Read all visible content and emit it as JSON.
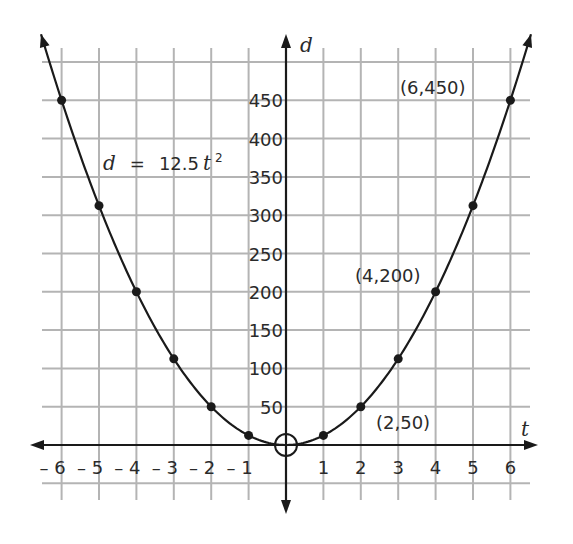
{
  "chart_data": {
    "type": "line",
    "title": "",
    "equation": "d = 12.5t²",
    "equation_parts": {
      "lhs": "d",
      "eq": "=",
      "coef": "12.5",
      "var": "t",
      "exp": "2"
    },
    "xlabel": "t",
    "ylabel": "d",
    "xlim": [
      -6.5,
      6.5
    ],
    "ylim": [
      -50,
      500
    ],
    "grid": true,
    "x_ticks": [
      -6,
      -5,
      -4,
      -3,
      -2,
      -1,
      1,
      2,
      3,
      4,
      5,
      6
    ],
    "x_tick_labels": [
      "– 6",
      "– 5",
      "– 4",
      "– 3",
      "– 2",
      "– 1",
      "1",
      "2",
      "3",
      "4",
      "5",
      "6"
    ],
    "y_ticks": [
      50,
      100,
      150,
      200,
      250,
      300,
      350,
      400,
      450
    ],
    "y_tick_labels": [
      "50",
      "100",
      "150",
      "200",
      "250",
      "300",
      "350",
      "400",
      "450"
    ],
    "points": [
      {
        "t": -6,
        "d": 450
      },
      {
        "t": -5,
        "d": 312.5
      },
      {
        "t": -4,
        "d": 200
      },
      {
        "t": -3,
        "d": 112.5
      },
      {
        "t": -2,
        "d": 50
      },
      {
        "t": -1,
        "d": 12.5
      },
      {
        "t": 1,
        "d": 12.5
      },
      {
        "t": 2,
        "d": 50
      },
      {
        "t": 3,
        "d": 112.5
      },
      {
        "t": 4,
        "d": 200
      },
      {
        "t": 5,
        "d": 312.5
      },
      {
        "t": 6,
        "d": 450
      }
    ],
    "vertex": {
      "t": 0,
      "d": 0,
      "marker": "open-circle"
    },
    "annotations": [
      {
        "text": "(6,450)",
        "t": 6,
        "d": 450
      },
      {
        "text": "(4,200)",
        "t": 4,
        "d": 200
      },
      {
        "text": "(2,50)",
        "t": 2,
        "d": 50
      }
    ]
  }
}
